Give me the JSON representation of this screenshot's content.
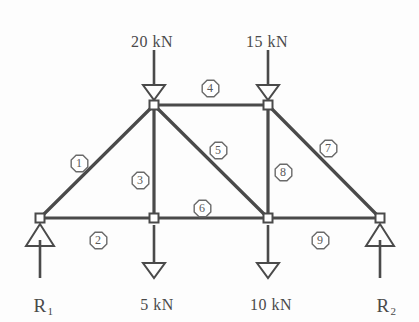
{
  "diagram": {
    "type": "truss-free-body-diagram",
    "line_color": "#4a4a4a",
    "text_color": "#4a4a4a",
    "background": "#fdfdfd"
  },
  "loads": [
    {
      "name": "load-20kn",
      "label": "20 kN",
      "x": 152,
      "y": 33,
      "arrow_x": 154,
      "arrow_top": 50,
      "arrow_bottom": 100,
      "direction": "down"
    },
    {
      "name": "load-15kn",
      "label": "15 kN",
      "x": 267,
      "y": 33,
      "arrow_x": 268,
      "arrow_top": 50,
      "arrow_bottom": 100,
      "direction": "down"
    },
    {
      "name": "load-5kn",
      "label": "5 kN",
      "x": 157,
      "y": 296,
      "arrow_x": 154,
      "arrow_top": 225,
      "arrow_bottom": 278,
      "direction": "down"
    },
    {
      "name": "load-10kn",
      "label": "10 kN",
      "x": 271,
      "y": 296,
      "arrow_x": 268,
      "arrow_top": 225,
      "arrow_bottom": 278,
      "direction": "down"
    }
  ],
  "reactions": [
    {
      "name": "reaction-r1",
      "label": "R",
      "subscript": "1",
      "x": 43,
      "y": 295,
      "arrow_x": 40,
      "arrow_top": 228,
      "arrow_bottom": 278,
      "direction": "up"
    },
    {
      "name": "reaction-r2",
      "label": "R",
      "subscript": "2",
      "x": 386,
      "y": 295,
      "arrow_x": 380,
      "arrow_top": 228,
      "arrow_bottom": 278,
      "direction": "up"
    }
  ],
  "joints": [
    {
      "name": "joint-top-left",
      "id": "A",
      "x": 154,
      "y": 105
    },
    {
      "name": "joint-top-right",
      "id": "B",
      "x": 268,
      "y": 105
    },
    {
      "name": "joint-bottom-left",
      "id": "C",
      "x": 40,
      "y": 218
    },
    {
      "name": "joint-bottom-mid-left",
      "id": "D",
      "x": 154,
      "y": 218
    },
    {
      "name": "joint-bottom-mid-right",
      "id": "E",
      "x": 268,
      "y": 218
    },
    {
      "name": "joint-bottom-right",
      "id": "F",
      "x": 380,
      "y": 218
    }
  ],
  "supports": [
    {
      "name": "support-left",
      "x": 40,
      "y": 218,
      "type": "pin"
    },
    {
      "name": "support-right",
      "x": 380,
      "y": 218,
      "type": "pin"
    }
  ],
  "members": [
    {
      "name": "member-1",
      "number": "1",
      "from": "C",
      "to": "A",
      "x1": 40,
      "y1": 218,
      "x2": 154,
      "y2": 105,
      "label_x": 79,
      "label_y": 163
    },
    {
      "name": "member-2",
      "number": "2",
      "from": "C",
      "to": "D",
      "x1": 40,
      "y1": 218,
      "x2": 154,
      "y2": 218,
      "label_x": 98,
      "label_y": 240
    },
    {
      "name": "member-3",
      "number": "3",
      "from": "A",
      "to": "D",
      "x1": 154,
      "y1": 105,
      "x2": 154,
      "y2": 218,
      "label_x": 140,
      "label_y": 180
    },
    {
      "name": "member-4",
      "number": "4",
      "from": "A",
      "to": "B",
      "x1": 154,
      "y1": 105,
      "x2": 268,
      "y2": 105,
      "label_x": 210,
      "label_y": 88
    },
    {
      "name": "member-5",
      "number": "5",
      "from": "A",
      "to": "E",
      "x1": 154,
      "y1": 105,
      "x2": 268,
      "y2": 218,
      "label_x": 218,
      "label_y": 150
    },
    {
      "name": "member-6",
      "number": "6",
      "from": "D",
      "to": "E",
      "x1": 154,
      "y1": 218,
      "x2": 268,
      "y2": 218,
      "label_x": 202,
      "label_y": 208
    },
    {
      "name": "member-7",
      "number": "7",
      "from": "B",
      "to": "F",
      "x1": 268,
      "y1": 105,
      "x2": 380,
      "y2": 218,
      "label_x": 328,
      "label_y": 148
    },
    {
      "name": "member-8",
      "number": "8",
      "from": "B",
      "to": "E",
      "x1": 268,
      "y1": 105,
      "x2": 268,
      "y2": 218,
      "label_x": 283,
      "label_y": 172
    },
    {
      "name": "member-9",
      "number": "9",
      "from": "E",
      "to": "F",
      "x1": 268,
      "y1": 218,
      "x2": 380,
      "y2": 218,
      "label_x": 320,
      "label_y": 240
    }
  ]
}
